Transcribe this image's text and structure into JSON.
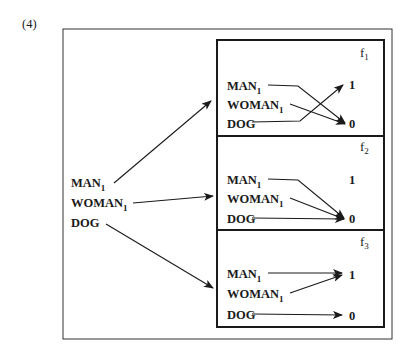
{
  "figure": {
    "number_label": "(4)",
    "colors": {
      "ink": "#1a1a1a",
      "background": "#ffffff"
    }
  },
  "domain_entities": [
    {
      "name": "MAN",
      "subscript": "1"
    },
    {
      "name": "WOMAN",
      "subscript": "1"
    },
    {
      "name": "DOG",
      "subscript": ""
    }
  ],
  "functions": [
    {
      "label": "f",
      "subscript": "1",
      "mapping": {
        "MAN1": "0",
        "WOMAN1": "0",
        "DOG": "1"
      }
    },
    {
      "label": "f",
      "subscript": "2",
      "mapping": {
        "MAN1": "0",
        "WOMAN1": "0",
        "DOG": "0"
      }
    },
    {
      "label": "f",
      "subscript": "3",
      "mapping": {
        "MAN1": "1",
        "WOMAN1": "1",
        "DOG": "0"
      }
    }
  ],
  "values": {
    "one": "1",
    "zero": "0"
  }
}
